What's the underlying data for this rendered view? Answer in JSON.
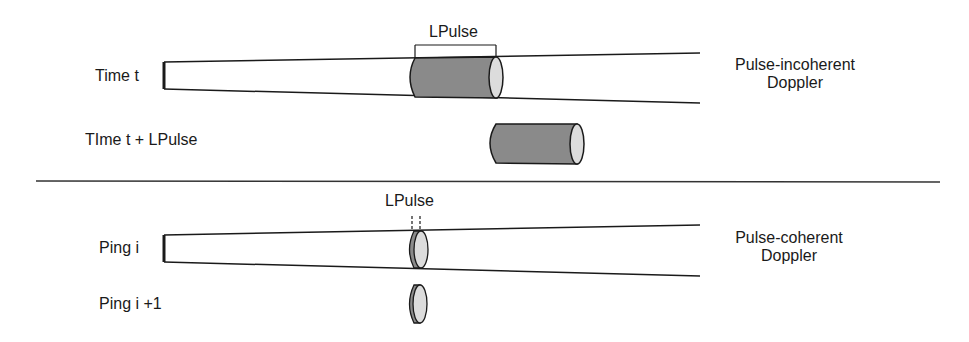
{
  "diagram": {
    "top_panel": {
      "row1_label": "Time t",
      "row2_label": "TIme t + LPulse",
      "pulse_label": "LPulse",
      "mode_label_line1": "Pulse-incoherent",
      "mode_label_line2": "Doppler"
    },
    "bottom_panel": {
      "row1_label": "Ping i",
      "row2_label": "Ping i +1",
      "pulse_label": "LPulse",
      "mode_label_line1": "Pulse-coherent",
      "mode_label_line2": "Doppler"
    },
    "colors": {
      "stroke": "#1a1a1a",
      "pulse_body": "#8a8a8a",
      "pulse_face": "#dcdcdc",
      "divider": "#333333"
    }
  }
}
